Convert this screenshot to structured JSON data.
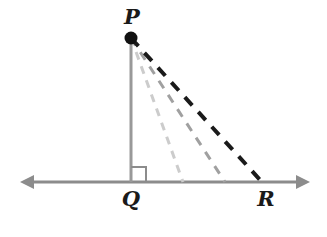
{
  "figure": {
    "type": "geometry-diagram",
    "width": 327,
    "height": 237,
    "background": "#ffffff"
  },
  "labels": {
    "p": "P",
    "q": "Q",
    "r": "R"
  },
  "colors": {
    "line_gray": "#8c8c8c",
    "vertical_gray": "#999999",
    "ray_dark": "#1a1a1a",
    "ray_medium": "#a0a0a0",
    "ray_light": "#cccccc",
    "point_fill": "#111111",
    "right_angle": "#8c8c8c"
  },
  "geometry": {
    "point_P": {
      "x": 131,
      "y": 38,
      "radius": 6
    },
    "point_Q": {
      "x": 131,
      "y": 182
    },
    "point_R": {
      "x": 262,
      "y": 182
    },
    "baseline": {
      "y": 182,
      "x_start": 20,
      "x_end": 310,
      "arrow_left": true,
      "arrow_right": true,
      "stroke_width": 3
    },
    "segment_PQ": {
      "x1": 131,
      "y1": 38,
      "x2": 131,
      "y2": 182,
      "stroke_width": 3,
      "style": "solid"
    },
    "right_angle_marker": {
      "x": 131,
      "y": 167,
      "size": 15,
      "stroke_width": 2,
      "at_vertex": "Q"
    },
    "dashed_rays": [
      {
        "name": "ray-P-to-light",
        "shade": "light",
        "x1": 131,
        "y1": 38,
        "x2": 183,
        "y2": 182,
        "stroke_width": 3,
        "dash": "8 7"
      },
      {
        "name": "ray-P-to-medium",
        "shade": "medium",
        "x1": 131,
        "y1": 38,
        "x2": 225,
        "y2": 182,
        "stroke_width": 3,
        "dash": "9 8"
      },
      {
        "name": "ray-P-to-R",
        "shade": "dark",
        "x1": 131,
        "y1": 38,
        "x2": 262,
        "y2": 182,
        "stroke_width": 4,
        "dash": "11 9"
      }
    ]
  }
}
